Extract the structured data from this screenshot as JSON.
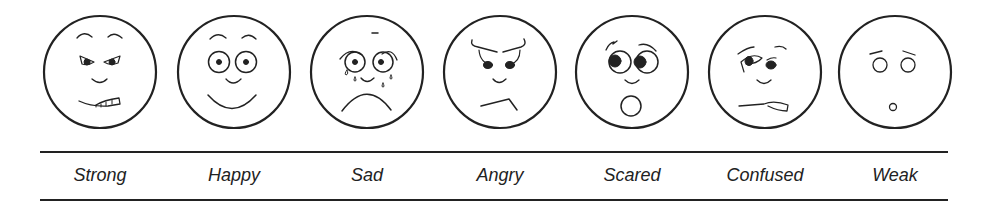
{
  "stroke_color": "#222222",
  "faces": [
    {
      "id": "strong",
      "label": "Strong",
      "cx": 100
    },
    {
      "id": "happy",
      "label": "Happy",
      "cx": 234
    },
    {
      "id": "sad",
      "label": "Sad",
      "cx": 367
    },
    {
      "id": "angry",
      "label": "Angry",
      "cx": 500
    },
    {
      "id": "scared",
      "label": "Scared",
      "cx": 632
    },
    {
      "id": "confused",
      "label": "Confused",
      "cx": 765
    },
    {
      "id": "weak",
      "label": "Weak",
      "cx": 895
    }
  ]
}
